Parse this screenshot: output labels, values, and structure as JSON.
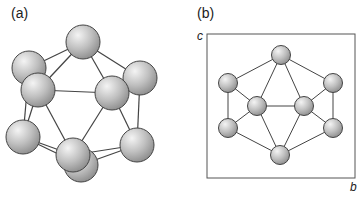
{
  "panels": {
    "a": {
      "label": "(a)"
    },
    "b": {
      "label": "(b)",
      "axis_c": "c",
      "axis_b": "b"
    }
  },
  "colors": {
    "sphere_light": "#f2f2f2",
    "sphere_mid": "#bdbdbd",
    "sphere_dark": "#8a8a8a",
    "outline": "#444444",
    "bond": "#444444",
    "box": "#555555"
  },
  "panel_a": {
    "radius": 17,
    "atoms": [
      {
        "id": "back-upper-left",
        "x": 29,
        "y": 68
      },
      {
        "id": "back-right",
        "x": 140,
        "y": 78
      },
      {
        "id": "back-bottom",
        "x": 81,
        "y": 165
      },
      {
        "id": "top",
        "x": 83,
        "y": 42
      },
      {
        "id": "lower-left",
        "x": 23,
        "y": 137
      },
      {
        "id": "lower-right",
        "x": 137,
        "y": 145
      },
      {
        "id": "front-upper-left",
        "x": 38,
        "y": 90
      },
      {
        "id": "front-center-right",
        "x": 112,
        "y": 93
      },
      {
        "id": "front-bottom",
        "x": 73,
        "y": 155
      }
    ],
    "bonds": [
      [
        "top",
        "back-upper-left"
      ],
      [
        "top",
        "front-upper-left"
      ],
      [
        "top",
        "front-center-right"
      ],
      [
        "top",
        "back-right"
      ],
      [
        "front-upper-left",
        "front-center-right"
      ],
      [
        "front-upper-left",
        "lower-left"
      ],
      [
        "back-upper-left",
        "lower-left"
      ],
      [
        "front-upper-left",
        "front-bottom"
      ],
      [
        "front-center-right",
        "front-bottom"
      ],
      [
        "front-center-right",
        "lower-right"
      ],
      [
        "back-right",
        "lower-right"
      ],
      [
        "lower-left",
        "front-bottom"
      ],
      [
        "lower-left",
        "back-bottom"
      ],
      [
        "lower-right",
        "front-bottom"
      ],
      [
        "lower-right",
        "back-bottom"
      ]
    ]
  },
  "panel_b": {
    "radius": 9.5,
    "box": {
      "x": 207,
      "y": 34,
      "w": 148,
      "h": 144
    },
    "atoms": [
      {
        "id": "top",
        "x": 281,
        "y": 55
      },
      {
        "id": "upper-left",
        "x": 228,
        "y": 83
      },
      {
        "id": "upper-right",
        "x": 333,
        "y": 83
      },
      {
        "id": "inner-left",
        "x": 257,
        "y": 106
      },
      {
        "id": "inner-right",
        "x": 304,
        "y": 106
      },
      {
        "id": "lower-left",
        "x": 228,
        "y": 128
      },
      {
        "id": "lower-right",
        "x": 333,
        "y": 128
      },
      {
        "id": "bottom",
        "x": 280,
        "y": 155
      }
    ],
    "bonds": [
      [
        "top",
        "upper-left"
      ],
      [
        "top",
        "upper-right"
      ],
      [
        "top",
        "inner-left"
      ],
      [
        "top",
        "inner-right"
      ],
      [
        "upper-left",
        "inner-left"
      ],
      [
        "upper-right",
        "inner-right"
      ],
      [
        "upper-left",
        "lower-left"
      ],
      [
        "upper-right",
        "lower-right"
      ],
      [
        "inner-left",
        "inner-right"
      ],
      [
        "inner-left",
        "lower-left"
      ],
      [
        "inner-right",
        "lower-right"
      ],
      [
        "inner-left",
        "bottom"
      ],
      [
        "inner-right",
        "bottom"
      ],
      [
        "lower-left",
        "bottom"
      ],
      [
        "lower-right",
        "bottom"
      ]
    ]
  }
}
